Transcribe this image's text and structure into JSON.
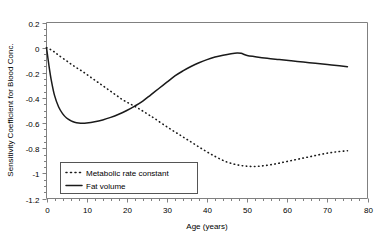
{
  "chart_data": {
    "type": "line",
    "title": "",
    "xlabel": "Age (years)",
    "ylabel": "Sensitivity Coefficient for Blood Conc.",
    "xlim": [
      0,
      80
    ],
    "ylim": [
      -1.2,
      0.2
    ],
    "grid": false,
    "legend_position": "bottom-left",
    "x_major_ticks": [
      0,
      10,
      20,
      30,
      40,
      50,
      60,
      70,
      80
    ],
    "x_tick_labels": [
      "0",
      "10",
      "20",
      "30",
      "40",
      "50",
      "60",
      "70",
      "80"
    ],
    "x_minor_step": 2,
    "y_major_ticks": [
      0.2,
      0,
      -0.2,
      -0.4,
      -0.6,
      -0.8,
      -1,
      -1.2
    ],
    "y_tick_labels": [
      "0.2",
      "0",
      "-0.2",
      "-0.4",
      "-0.6",
      "-0.8",
      "-1",
      "-1.2"
    ],
    "y_minor_step": 0.05,
    "series": [
      {
        "name": "Metabolic rate constant",
        "style": "dotted",
        "color": "#1a1a1a",
        "x": [
          0,
          1,
          2,
          3,
          5,
          7,
          9,
          11,
          13,
          15,
          17,
          19,
          21,
          23,
          25,
          27,
          30,
          33,
          36,
          39,
          42,
          45,
          48,
          51,
          54,
          57,
          60,
          63,
          66,
          69,
          72,
          75
        ],
        "y": [
          0.0,
          -0.015,
          -0.035,
          -0.06,
          -0.105,
          -0.15,
          -0.19,
          -0.235,
          -0.28,
          -0.325,
          -0.37,
          -0.415,
          -0.45,
          -0.485,
          -0.525,
          -0.565,
          -0.63,
          -0.69,
          -0.75,
          -0.81,
          -0.865,
          -0.91,
          -0.935,
          -0.945,
          -0.94,
          -0.925,
          -0.905,
          -0.885,
          -0.865,
          -0.845,
          -0.83,
          -0.82
        ]
      },
      {
        "name": "Fat volume",
        "style": "solid",
        "color": "#1a1a1a",
        "x": [
          0,
          0.6,
          1.2,
          2,
          3,
          4,
          5,
          6,
          7,
          8,
          9,
          10,
          12,
          14,
          16,
          18,
          20,
          22,
          24,
          26,
          28,
          30,
          32,
          34,
          36,
          38,
          40,
          42,
          44,
          46,
          47.5,
          48.5,
          50,
          52,
          55,
          58,
          61,
          64,
          67,
          70,
          73,
          75
        ],
        "y": [
          0.0,
          -0.14,
          -0.26,
          -0.38,
          -0.47,
          -0.525,
          -0.56,
          -0.58,
          -0.593,
          -0.6,
          -0.602,
          -0.6,
          -0.59,
          -0.575,
          -0.555,
          -0.53,
          -0.5,
          -0.465,
          -0.425,
          -0.375,
          -0.325,
          -0.275,
          -0.225,
          -0.185,
          -0.15,
          -0.12,
          -0.095,
          -0.075,
          -0.06,
          -0.048,
          -0.042,
          -0.045,
          -0.062,
          -0.072,
          -0.085,
          -0.095,
          -0.105,
          -0.115,
          -0.125,
          -0.135,
          -0.145,
          -0.152
        ]
      }
    ]
  },
  "axis": {
    "y_title": "Sensitivity Coefficient for Blood Conc.",
    "x_title": "Age (years)"
  },
  "legend": {
    "entries": [
      {
        "label": "Metabolic rate constant",
        "marker": "dotted-line-swatch"
      },
      {
        "label": "Fat volume",
        "marker": "solid-line-swatch"
      }
    ]
  },
  "colors": {
    "series": "#1a1a1a",
    "axis": "#808080",
    "legend_border": "#555555",
    "background": "#ffffff"
  }
}
